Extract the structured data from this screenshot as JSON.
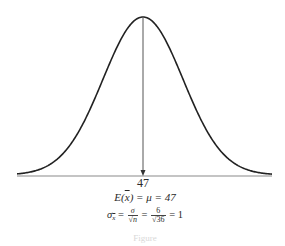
{
  "chart_data": {
    "type": "line",
    "title": "",
    "xlabel": "",
    "ylabel": "",
    "x_ticks": [
      "47"
    ],
    "mean_marker": {
      "x": 47,
      "label": "47",
      "style": "arrow from peak to axis"
    },
    "distribution": {
      "family": "normal",
      "mean": 47,
      "std_error": 1
    },
    "grid": false,
    "legend": null,
    "annotations": [
      "E(x̄) = μ = 47",
      "σx̄ = σ/√n = 6/√36 = 1"
    ]
  },
  "labels": {
    "tick_mean": "47",
    "expectation": {
      "lhs": "E(",
      "var": "x",
      "rhs": ") = μ = 47"
    },
    "std_error": {
      "sigma": "σ",
      "sub": "x",
      "eq1": " = ",
      "f1_num": "σ",
      "f1_den": "√n",
      "eq2": " = ",
      "f2_num": "6",
      "f2_den": "√36",
      "eq3": " = 1"
    },
    "caption": "Figure"
  }
}
